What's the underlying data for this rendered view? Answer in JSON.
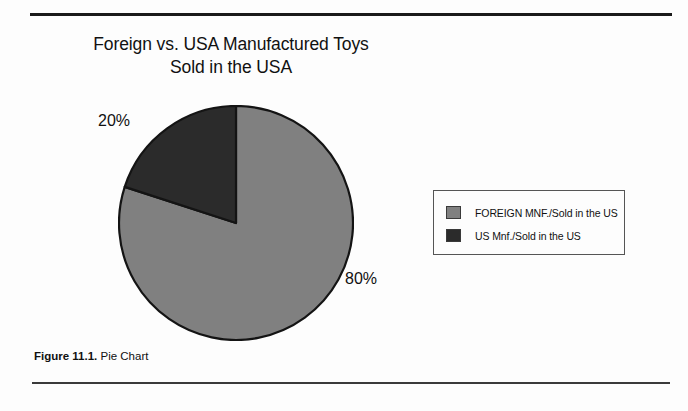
{
  "figure": {
    "title_line1": "Foreign vs. USA Manufactured Toys",
    "title_line2": "Sold in the USA",
    "caption_number": "Figure 11.1.",
    "caption_text": "Pie Chart"
  },
  "legend": {
    "position": "right",
    "entries": [
      {
        "label": "FOREIGN MNF./Sold in the US",
        "color": "#808080"
      },
      {
        "label": "US Mnf./Sold in the US",
        "color": "#2b2b2b"
      }
    ]
  },
  "labels": {
    "light_slice_pct": "80%",
    "dark_slice_pct": "20%"
  },
  "colors": {
    "page_background": "#fdfdfd",
    "foreign_slice": "#808080",
    "us_slice": "#2b2b2b",
    "outline": "#141414",
    "rule": "#1a1a1a",
    "text": "#111111"
  },
  "chart_data": {
    "type": "pie",
    "title": "Foreign vs. USA Manufactured Toys Sold in the USA",
    "labels": [
      "FOREIGN MNF./Sold in the US",
      "US Mnf./Sold in the US"
    ],
    "values": [
      80,
      20
    ],
    "value_labels": [
      "80%",
      "20%"
    ],
    "colors": [
      "#808080",
      "#2b2b2b"
    ],
    "units": "percent",
    "start_angle_deg": 90,
    "direction": "clockwise",
    "legend": "right",
    "grid": false
  }
}
